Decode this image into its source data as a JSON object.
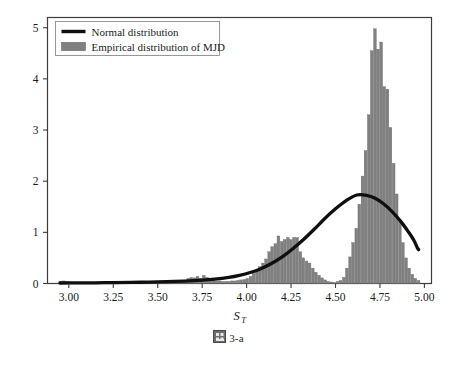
{
  "figure": {
    "caption_glyph": "missing-glyph-box",
    "caption_text": "3-a"
  },
  "chart_data": {
    "type": "bar",
    "title": "",
    "subtitle": "",
    "xlabel": "S_T",
    "xlabel_base": "S",
    "xlabel_sub": "T",
    "ylabel": "",
    "xlim": [
      2.88,
      5.04
    ],
    "ylim": [
      0,
      5.2
    ],
    "grid": false,
    "legend_position": "top-left",
    "axis_color": "#3c3c3c",
    "bar_color": "#808080",
    "bar_edge_color": "#6e6e6e",
    "curve_color": "#0f0f0f",
    "xticks": [
      3.0,
      3.25,
      3.5,
      3.75,
      4.0,
      4.25,
      4.5,
      4.75,
      5.0
    ],
    "xtick_labels": [
      "3.00",
      "3.25",
      "3.50",
      "3.75",
      "4.00",
      "4.25",
      "4.50",
      "4.75",
      "5.00"
    ],
    "yticks": [
      0,
      1,
      2,
      3,
      4,
      5
    ],
    "ytick_labels": [
      "0",
      "1",
      "2",
      "3",
      "4",
      "5"
    ],
    "legend": [
      {
        "label": "Normal distribution",
        "marker": "line",
        "color": "#0f0f0f"
      },
      {
        "label": "Empirical distribution of MJD",
        "marker": "patch",
        "color": "#808080"
      }
    ],
    "series": [
      {
        "name": "Empirical distribution of MJD",
        "type": "bar",
        "bin_width": 0.0175,
        "bins": [
          {
            "x": 2.955,
            "y": 0.04
          },
          {
            "x": 2.973,
            "y": 0.05
          },
          {
            "x": 2.99,
            "y": 0.04
          },
          {
            "x": 3.008,
            "y": 0.02
          },
          {
            "x": 3.025,
            "y": 0.02
          },
          {
            "x": 3.043,
            "y": 0.01
          },
          {
            "x": 3.06,
            "y": 0.01
          },
          {
            "x": 3.078,
            "y": 0.01
          },
          {
            "x": 3.095,
            "y": 0.01
          },
          {
            "x": 3.113,
            "y": 0.01
          },
          {
            "x": 3.13,
            "y": 0.01
          },
          {
            "x": 3.148,
            "y": 0.01
          },
          {
            "x": 3.165,
            "y": 0.01
          },
          {
            "x": 3.183,
            "y": 0.01
          },
          {
            "x": 3.2,
            "y": 0.01
          },
          {
            "x": 3.218,
            "y": 0.01
          },
          {
            "x": 3.235,
            "y": 0.01
          },
          {
            "x": 3.253,
            "y": 0.01
          },
          {
            "x": 3.27,
            "y": 0.01
          },
          {
            "x": 3.288,
            "y": 0.01
          },
          {
            "x": 3.305,
            "y": 0.01
          },
          {
            "x": 3.323,
            "y": 0.02
          },
          {
            "x": 3.34,
            "y": 0.02
          },
          {
            "x": 3.358,
            "y": 0.02
          },
          {
            "x": 3.375,
            "y": 0.02
          },
          {
            "x": 3.393,
            "y": 0.02
          },
          {
            "x": 3.41,
            "y": 0.02
          },
          {
            "x": 3.428,
            "y": 0.02
          },
          {
            "x": 3.445,
            "y": 0.02
          },
          {
            "x": 3.463,
            "y": 0.02
          },
          {
            "x": 3.48,
            "y": 0.03
          },
          {
            "x": 3.498,
            "y": 0.03
          },
          {
            "x": 3.515,
            "y": 0.03
          },
          {
            "x": 3.533,
            "y": 0.03
          },
          {
            "x": 3.55,
            "y": 0.03
          },
          {
            "x": 3.568,
            "y": 0.03
          },
          {
            "x": 3.585,
            "y": 0.04
          },
          {
            "x": 3.603,
            "y": 0.04
          },
          {
            "x": 3.62,
            "y": 0.04
          },
          {
            "x": 3.638,
            "y": 0.05
          },
          {
            "x": 3.655,
            "y": 0.06
          },
          {
            "x": 3.673,
            "y": 0.1
          },
          {
            "x": 3.69,
            "y": 0.12
          },
          {
            "x": 3.708,
            "y": 0.11
          },
          {
            "x": 3.725,
            "y": 0.14
          },
          {
            "x": 3.743,
            "y": 0.1
          },
          {
            "x": 3.76,
            "y": 0.16
          },
          {
            "x": 3.778,
            "y": 0.12
          },
          {
            "x": 3.795,
            "y": 0.09
          },
          {
            "x": 3.813,
            "y": 0.06
          },
          {
            "x": 3.83,
            "y": 0.05
          },
          {
            "x": 3.848,
            "y": 0.05
          },
          {
            "x": 3.865,
            "y": 0.04
          },
          {
            "x": 3.883,
            "y": 0.04
          },
          {
            "x": 3.9,
            "y": 0.04
          },
          {
            "x": 3.918,
            "y": 0.05
          },
          {
            "x": 3.935,
            "y": 0.05
          },
          {
            "x": 3.953,
            "y": 0.06
          },
          {
            "x": 3.97,
            "y": 0.07
          },
          {
            "x": 3.988,
            "y": 0.08
          },
          {
            "x": 4.005,
            "y": 0.1
          },
          {
            "x": 4.023,
            "y": 0.14
          },
          {
            "x": 4.04,
            "y": 0.2
          },
          {
            "x": 4.058,
            "y": 0.26
          },
          {
            "x": 4.075,
            "y": 0.33
          },
          {
            "x": 4.093,
            "y": 0.4
          },
          {
            "x": 4.11,
            "y": 0.48
          },
          {
            "x": 4.128,
            "y": 0.62
          },
          {
            "x": 4.145,
            "y": 0.72
          },
          {
            "x": 4.163,
            "y": 0.78
          },
          {
            "x": 4.18,
            "y": 0.93
          },
          {
            "x": 4.198,
            "y": 0.82
          },
          {
            "x": 4.215,
            "y": 0.86
          },
          {
            "x": 4.233,
            "y": 0.9
          },
          {
            "x": 4.25,
            "y": 0.86
          },
          {
            "x": 4.268,
            "y": 0.9
          },
          {
            "x": 4.285,
            "y": 0.9
          },
          {
            "x": 4.303,
            "y": 0.62
          },
          {
            "x": 4.32,
            "y": 0.5
          },
          {
            "x": 4.338,
            "y": 0.44
          },
          {
            "x": 4.355,
            "y": 0.4
          },
          {
            "x": 4.373,
            "y": 0.3
          },
          {
            "x": 4.39,
            "y": 0.22
          },
          {
            "x": 4.408,
            "y": 0.16
          },
          {
            "x": 4.425,
            "y": 0.11
          },
          {
            "x": 4.443,
            "y": 0.07
          },
          {
            "x": 4.46,
            "y": 0.04
          },
          {
            "x": 4.478,
            "y": 0.03
          },
          {
            "x": 4.495,
            "y": 0.02
          },
          {
            "x": 4.513,
            "y": 0.04
          },
          {
            "x": 4.53,
            "y": 0.06
          },
          {
            "x": 4.548,
            "y": 0.12
          },
          {
            "x": 4.565,
            "y": 0.3
          },
          {
            "x": 4.583,
            "y": 0.52
          },
          {
            "x": 4.6,
            "y": 0.8
          },
          {
            "x": 4.618,
            "y": 1.08
          },
          {
            "x": 4.635,
            "y": 1.55
          },
          {
            "x": 4.653,
            "y": 2.1
          },
          {
            "x": 4.67,
            "y": 2.6
          },
          {
            "x": 4.688,
            "y": 3.3
          },
          {
            "x": 4.705,
            "y": 4.55
          },
          {
            "x": 4.723,
            "y": 4.98
          },
          {
            "x": 4.74,
            "y": 4.58
          },
          {
            "x": 4.758,
            "y": 4.72
          },
          {
            "x": 4.775,
            "y": 3.85
          },
          {
            "x": 4.793,
            "y": 3.8
          },
          {
            "x": 4.81,
            "y": 3.05
          },
          {
            "x": 4.828,
            "y": 2.35
          },
          {
            "x": 4.845,
            "y": 1.75
          },
          {
            "x": 4.863,
            "y": 1.2
          },
          {
            "x": 4.88,
            "y": 0.8
          },
          {
            "x": 4.898,
            "y": 0.5
          },
          {
            "x": 4.915,
            "y": 0.3
          },
          {
            "x": 4.933,
            "y": 0.18
          },
          {
            "x": 4.95,
            "y": 0.1
          },
          {
            "x": 4.968,
            "y": 0.06
          }
        ]
      },
      {
        "name": "Normal distribution",
        "type": "line",
        "mean": 4.62,
        "peak_value": 1.73,
        "points": [
          {
            "x": 2.95,
            "y": 0.01
          },
          {
            "x": 3.05,
            "y": 0.012
          },
          {
            "x": 3.15,
            "y": 0.014
          },
          {
            "x": 3.25,
            "y": 0.018
          },
          {
            "x": 3.35,
            "y": 0.022
          },
          {
            "x": 3.45,
            "y": 0.028
          },
          {
            "x": 3.55,
            "y": 0.036
          },
          {
            "x": 3.65,
            "y": 0.048
          },
          {
            "x": 3.75,
            "y": 0.066
          },
          {
            "x": 3.82,
            "y": 0.085
          },
          {
            "x": 3.9,
            "y": 0.12
          },
          {
            "x": 3.96,
            "y": 0.16
          },
          {
            "x": 4.02,
            "y": 0.215
          },
          {
            "x": 4.08,
            "y": 0.29
          },
          {
            "x": 4.14,
            "y": 0.39
          },
          {
            "x": 4.2,
            "y": 0.52
          },
          {
            "x": 4.26,
            "y": 0.68
          },
          {
            "x": 4.32,
            "y": 0.86
          },
          {
            "x": 4.38,
            "y": 1.06
          },
          {
            "x": 4.44,
            "y": 1.27
          },
          {
            "x": 4.5,
            "y": 1.46
          },
          {
            "x": 4.56,
            "y": 1.62
          },
          {
            "x": 4.62,
            "y": 1.73
          },
          {
            "x": 4.68,
            "y": 1.72
          },
          {
            "x": 4.72,
            "y": 1.67
          },
          {
            "x": 4.77,
            "y": 1.56
          },
          {
            "x": 4.82,
            "y": 1.4
          },
          {
            "x": 4.87,
            "y": 1.2
          },
          {
            "x": 4.91,
            "y": 1.01
          },
          {
            "x": 4.94,
            "y": 0.85
          },
          {
            "x": 4.96,
            "y": 0.7
          },
          {
            "x": 4.968,
            "y": 0.66
          }
        ]
      }
    ]
  }
}
